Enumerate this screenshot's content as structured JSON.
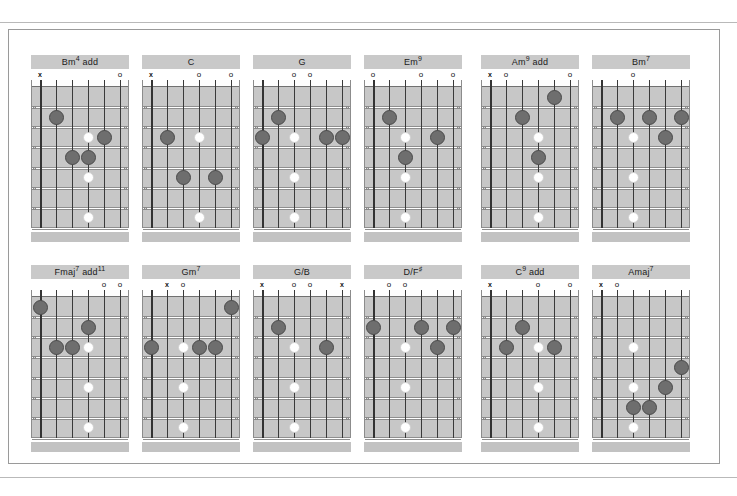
{
  "page": {
    "colors": {
      "board": "#c7c7c7",
      "title_bar": "#c9c9c9",
      "filled_dot": "#6e6e6e",
      "hollow_dot": "#ffffff",
      "string": "#3a3a3a",
      "frame_border": "#9a9a9a"
    },
    "layout": {
      "columns": 6,
      "rows": 2,
      "strings": 6,
      "frets": 7
    }
  },
  "chords": [
    {
      "name": "Bm add4",
      "root": "Bm",
      "suffix": "add",
      "sup": "4",
      "markers": [
        {
          "string": 1,
          "symbol": "x"
        },
        {
          "string": 6,
          "symbol": "o"
        }
      ],
      "dots": [
        {
          "string": 2,
          "fret": 2,
          "type": "filled"
        },
        {
          "string": 4,
          "fret": 3,
          "type": "hollow"
        },
        {
          "string": 5,
          "fret": 3,
          "type": "filled"
        },
        {
          "string": 3,
          "fret": 4,
          "type": "filled"
        },
        {
          "string": 4,
          "fret": 4,
          "type": "filled"
        },
        {
          "string": 4,
          "fret": 5,
          "type": "hollow"
        },
        {
          "string": 4,
          "fret": 7,
          "type": "hollow"
        }
      ]
    },
    {
      "name": "C",
      "root": "C",
      "suffix": "",
      "sup": "",
      "markers": [
        {
          "string": 1,
          "symbol": "x"
        },
        {
          "string": 4,
          "symbol": "o"
        },
        {
          "string": 6,
          "symbol": "o"
        }
      ],
      "dots": [
        {
          "string": 2,
          "fret": 3,
          "type": "filled"
        },
        {
          "string": 4,
          "fret": 3,
          "type": "hollow"
        },
        {
          "string": 3,
          "fret": 5,
          "type": "filled"
        },
        {
          "string": 5,
          "fret": 5,
          "type": "filled"
        },
        {
          "string": 4,
          "fret": 7,
          "type": "hollow"
        }
      ]
    },
    {
      "name": "G",
      "root": "G",
      "suffix": "",
      "sup": "",
      "markers": [
        {
          "string": 3,
          "symbol": "o"
        },
        {
          "string": 4,
          "symbol": "o"
        }
      ],
      "dots": [
        {
          "string": 2,
          "fret": 2,
          "type": "filled"
        },
        {
          "string": 1,
          "fret": 3,
          "type": "filled"
        },
        {
          "string": 3,
          "fret": 3,
          "type": "hollow"
        },
        {
          "string": 5,
          "fret": 3,
          "type": "filled"
        },
        {
          "string": 6,
          "fret": 3,
          "type": "filled"
        },
        {
          "string": 3,
          "fret": 5,
          "type": "hollow"
        },
        {
          "string": 3,
          "fret": 7,
          "type": "hollow"
        }
      ]
    },
    {
      "name": "Em9",
      "root": "Em",
      "suffix": "",
      "sup": "9",
      "markers": [
        {
          "string": 1,
          "symbol": "o"
        },
        {
          "string": 4,
          "symbol": "o"
        },
        {
          "string": 6,
          "symbol": "o"
        }
      ],
      "dots": [
        {
          "string": 2,
          "fret": 2,
          "type": "filled"
        },
        {
          "string": 3,
          "fret": 3,
          "type": "hollow"
        },
        {
          "string": 5,
          "fret": 3,
          "type": "filled"
        },
        {
          "string": 3,
          "fret": 4,
          "type": "filled"
        },
        {
          "string": 3,
          "fret": 5,
          "type": "hollow"
        },
        {
          "string": 3,
          "fret": 7,
          "type": "hollow"
        }
      ]
    },
    {
      "name": "Am add9",
      "root": "Am",
      "suffix": "add",
      "sup": "9",
      "markers": [
        {
          "string": 1,
          "symbol": "x"
        },
        {
          "string": 2,
          "symbol": "o"
        },
        {
          "string": 6,
          "symbol": "o"
        }
      ],
      "dots": [
        {
          "string": 5,
          "fret": 1,
          "type": "filled"
        },
        {
          "string": 3,
          "fret": 2,
          "type": "filled"
        },
        {
          "string": 4,
          "fret": 3,
          "type": "hollow"
        },
        {
          "string": 4,
          "fret": 4,
          "type": "filled"
        },
        {
          "string": 4,
          "fret": 5,
          "type": "hollow"
        },
        {
          "string": 4,
          "fret": 7,
          "type": "hollow"
        }
      ]
    },
    {
      "name": "Bm7",
      "root": "Bm",
      "suffix": "",
      "sup": "7",
      "markers": [
        {
          "string": 3,
          "symbol": "o"
        }
      ],
      "dots": [
        {
          "string": 2,
          "fret": 2,
          "type": "filled"
        },
        {
          "string": 4,
          "fret": 2,
          "type": "filled"
        },
        {
          "string": 6,
          "fret": 2,
          "type": "filled"
        },
        {
          "string": 3,
          "fret": 3,
          "type": "hollow"
        },
        {
          "string": 5,
          "fret": 3,
          "type": "filled"
        },
        {
          "string": 3,
          "fret": 5,
          "type": "hollow"
        },
        {
          "string": 3,
          "fret": 7,
          "type": "hollow"
        }
      ]
    },
    {
      "name": "Fmaj7add11",
      "root": "Fmaj",
      "suffix": "add",
      "sup": "7",
      "sup2": "11",
      "markers": [
        {
          "string": 5,
          "symbol": "o"
        },
        {
          "string": 6,
          "symbol": "o"
        }
      ],
      "dots": [
        {
          "string": 1,
          "fret": 1,
          "type": "filled"
        },
        {
          "string": 4,
          "fret": 2,
          "type": "filled"
        },
        {
          "string": 2,
          "fret": 3,
          "type": "filled"
        },
        {
          "string": 3,
          "fret": 3,
          "type": "filled"
        },
        {
          "string": 4,
          "fret": 3,
          "type": "hollow"
        },
        {
          "string": 4,
          "fret": 5,
          "type": "hollow"
        },
        {
          "string": 4,
          "fret": 7,
          "type": "hollow"
        }
      ]
    },
    {
      "name": "Gm7",
      "root": "Gm",
      "suffix": "",
      "sup": "7",
      "markers": [
        {
          "string": 2,
          "symbol": "x"
        },
        {
          "string": 3,
          "symbol": "o"
        }
      ],
      "dots": [
        {
          "string": 6,
          "fret": 1,
          "type": "filled"
        },
        {
          "string": 1,
          "fret": 3,
          "type": "filled"
        },
        {
          "string": 3,
          "fret": 3,
          "type": "hollow"
        },
        {
          "string": 4,
          "fret": 3,
          "type": "filled"
        },
        {
          "string": 5,
          "fret": 3,
          "type": "filled"
        },
        {
          "string": 3,
          "fret": 5,
          "type": "hollow"
        },
        {
          "string": 3,
          "fret": 7,
          "type": "hollow"
        }
      ]
    },
    {
      "name": "G/B",
      "root": "G/B",
      "suffix": "",
      "sup": "",
      "markers": [
        {
          "string": 1,
          "symbol": "x"
        },
        {
          "string": 3,
          "symbol": "o"
        },
        {
          "string": 4,
          "symbol": "o"
        },
        {
          "string": 6,
          "symbol": "x"
        }
      ],
      "dots": [
        {
          "string": 2,
          "fret": 2,
          "type": "filled"
        },
        {
          "string": 3,
          "fret": 3,
          "type": "hollow"
        },
        {
          "string": 5,
          "fret": 3,
          "type": "filled"
        },
        {
          "string": 3,
          "fret": 5,
          "type": "hollow"
        },
        {
          "string": 3,
          "fret": 7,
          "type": "hollow"
        }
      ]
    },
    {
      "name": "D/F#",
      "root": "D/F",
      "suffix": "",
      "sup": "♯",
      "markers": [
        {
          "string": 2,
          "symbol": "o"
        },
        {
          "string": 3,
          "symbol": "o"
        }
      ],
      "dots": [
        {
          "string": 1,
          "fret": 2,
          "type": "filled"
        },
        {
          "string": 4,
          "fret": 2,
          "type": "filled"
        },
        {
          "string": 6,
          "fret": 2,
          "type": "filled"
        },
        {
          "string": 3,
          "fret": 3,
          "type": "hollow"
        },
        {
          "string": 5,
          "fret": 3,
          "type": "filled"
        },
        {
          "string": 3,
          "fret": 5,
          "type": "hollow"
        },
        {
          "string": 3,
          "fret": 7,
          "type": "hollow"
        }
      ]
    },
    {
      "name": "C add9",
      "root": "C",
      "suffix": "add",
      "sup": "9",
      "markers": [
        {
          "string": 1,
          "symbol": "x"
        },
        {
          "string": 4,
          "symbol": "o"
        },
        {
          "string": 6,
          "symbol": "o"
        }
      ],
      "dots": [
        {
          "string": 3,
          "fret": 2,
          "type": "filled"
        },
        {
          "string": 2,
          "fret": 3,
          "type": "filled"
        },
        {
          "string": 4,
          "fret": 3,
          "type": "hollow"
        },
        {
          "string": 5,
          "fret": 3,
          "type": "filled"
        },
        {
          "string": 4,
          "fret": 5,
          "type": "hollow"
        },
        {
          "string": 4,
          "fret": 7,
          "type": "hollow"
        }
      ]
    },
    {
      "name": "Amaj7",
      "root": "Amaj",
      "suffix": "",
      "sup": "7",
      "markers": [
        {
          "string": 1,
          "symbol": "x"
        },
        {
          "string": 2,
          "symbol": "o"
        }
      ],
      "dots": [
        {
          "string": 3,
          "fret": 3,
          "type": "hollow"
        },
        {
          "string": 6,
          "fret": 4,
          "type": "filled"
        },
        {
          "string": 3,
          "fret": 5,
          "type": "hollow"
        },
        {
          "string": 5,
          "fret": 5,
          "type": "filled"
        },
        {
          "string": 3,
          "fret": 6,
          "type": "filled"
        },
        {
          "string": 4,
          "fret": 6,
          "type": "filled"
        },
        {
          "string": 3,
          "fret": 7,
          "type": "hollow"
        }
      ]
    }
  ]
}
